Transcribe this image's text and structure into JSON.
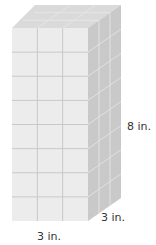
{
  "figure": {
    "type": "rectangular-prism-unit-cubes",
    "dimensions": {
      "width_cubes": 3,
      "depth_cubes": 3,
      "height_cubes": 8
    },
    "labels": {
      "height": "8 in.",
      "depth": "3 in.",
      "width": "3 in."
    },
    "colors": {
      "front_face": "#ececec",
      "side_face": "#c9c9c9",
      "top_face": "#dadada",
      "grid_line_front": "#c8c8c8",
      "grid_line_side": "#e2e2e2",
      "label_text": "#333333"
    }
  }
}
